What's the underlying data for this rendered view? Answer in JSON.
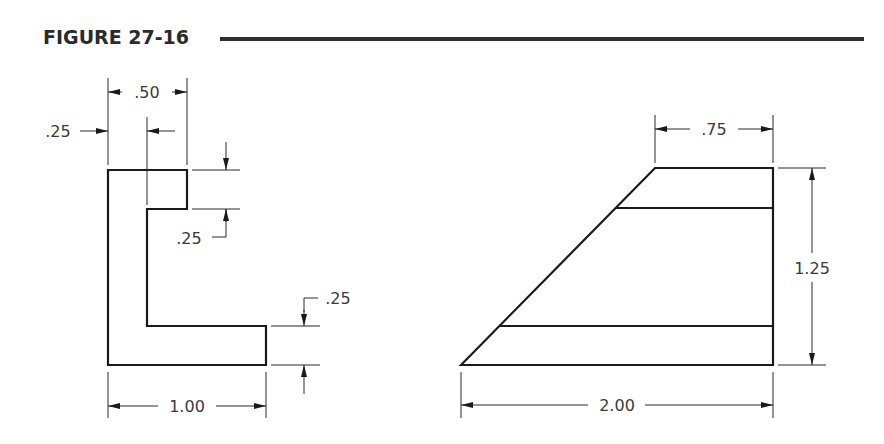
{
  "figure": {
    "title": "FIGURE 27-16"
  },
  "left_view": {
    "shape": "L-section",
    "dimensions": {
      "top_width": ".50",
      "wall_thickness": ".25",
      "notch_depth": ".25",
      "base_thickness": ".25",
      "overall_width": "1.00"
    }
  },
  "right_view": {
    "shape": "trapezoid",
    "dimensions": {
      "top_width": ".75",
      "height": "1.25",
      "bottom_width": "2.00"
    }
  },
  "colors": {
    "line": "#1a1a1a",
    "text": "#3a3a3a",
    "background": "#ffffff"
  }
}
